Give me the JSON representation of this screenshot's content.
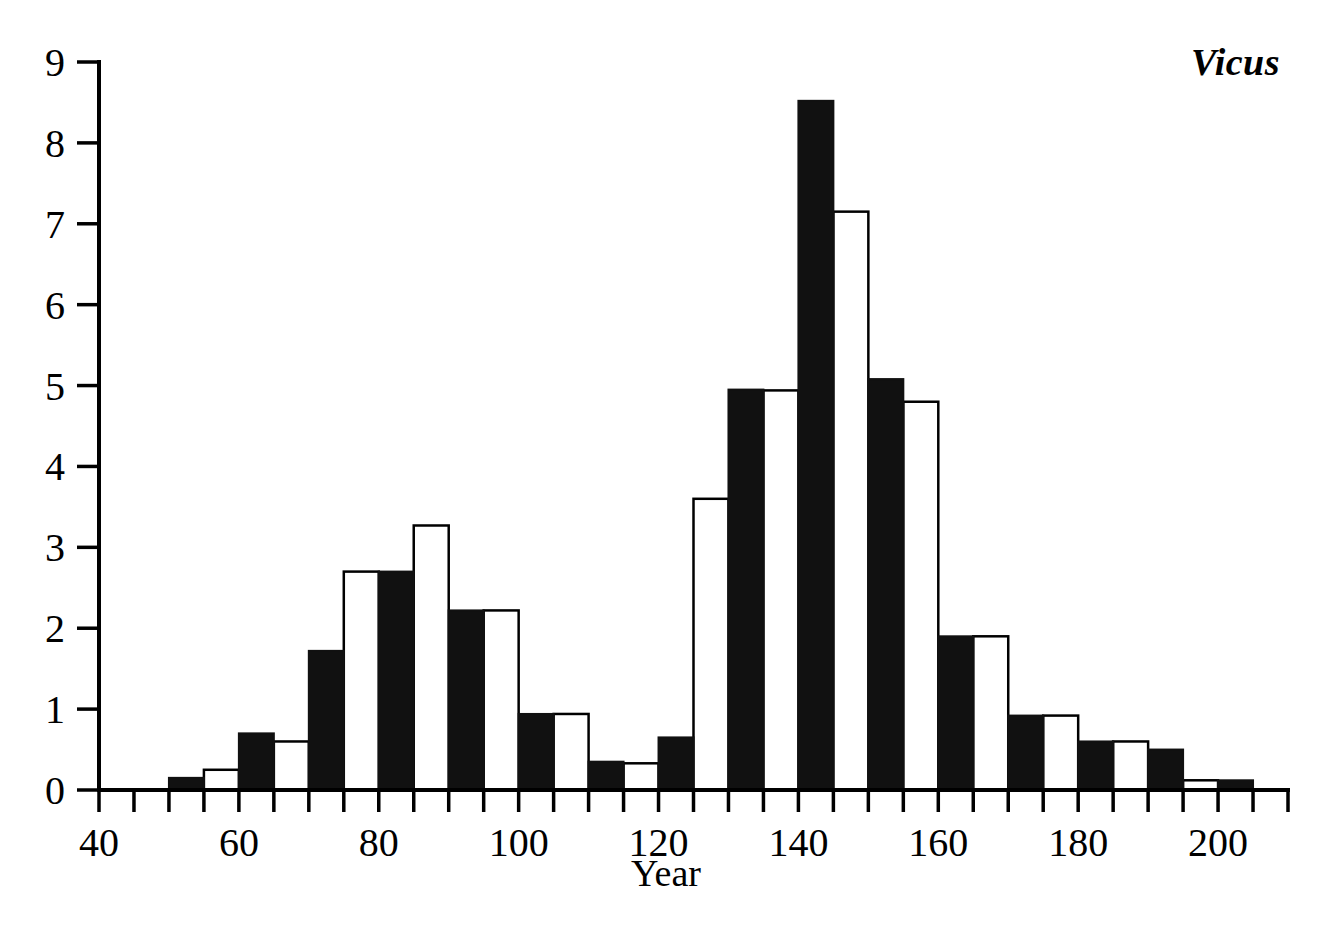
{
  "figure": {
    "title": "Vicus",
    "background_color": "#ffffff",
    "ink_color": "#000000"
  },
  "chart_data": {
    "type": "bar",
    "title": "Vicus",
    "subtitle": "",
    "xlabel": "Year",
    "ylabel": "",
    "xlim": [
      40,
      210
    ],
    "ylim": [
      0,
      9
    ],
    "grid": false,
    "legend_position": "none",
    "bar_width_years": 5,
    "x_tick_step": 5,
    "x_labeled_ticks": [
      40,
      60,
      80,
      100,
      120,
      140,
      160,
      180,
      200
    ],
    "x_tick_labels": [
      "40",
      "60",
      "80",
      "100",
      "120",
      "140",
      "160",
      "180",
      "200"
    ],
    "y_ticks": [
      0,
      1,
      2,
      3,
      4,
      5,
      6,
      7,
      8,
      9
    ],
    "y_tick_labels": [
      "0",
      "1",
      "2",
      "3",
      "4",
      "5",
      "6",
      "7",
      "8",
      "9"
    ],
    "bin_starts": [
      50,
      55,
      60,
      65,
      70,
      75,
      80,
      85,
      90,
      95,
      100,
      105,
      110,
      115,
      120,
      125,
      130,
      135,
      140,
      145,
      150,
      155,
      160,
      165,
      170,
      175,
      180,
      185,
      190,
      195,
      200
    ],
    "x": [
      52.5,
      57.5,
      62.5,
      67.5,
      72.5,
      77.5,
      82.5,
      87.5,
      92.5,
      97.5,
      102.5,
      107.5,
      112.5,
      117.5,
      122.5,
      127.5,
      132.5,
      137.5,
      142.5,
      147.5,
      152.5,
      157.5,
      162.5,
      167.5,
      172.5,
      177.5,
      182.5,
      187.5,
      192.5,
      197.5,
      202.5
    ],
    "values": [
      0.15,
      0.25,
      0.7,
      0.6,
      1.72,
      2.7,
      2.7,
      3.27,
      2.22,
      2.22,
      0.94,
      0.94,
      0.35,
      0.33,
      0.65,
      3.6,
      4.95,
      4.94,
      8.52,
      7.15,
      5.08,
      4.8,
      1.9,
      1.9,
      0.92,
      0.92,
      0.6,
      0.6,
      0.5,
      0.12,
      0.12
    ],
    "fills": [
      "filled",
      "open",
      "filled",
      "open",
      "filled",
      "open",
      "filled",
      "open",
      "filled",
      "open",
      "filled",
      "open",
      "filled",
      "open",
      "filled",
      "open",
      "filled",
      "open",
      "filled",
      "open",
      "filled",
      "open",
      "filled",
      "open",
      "filled",
      "open",
      "filled",
      "open",
      "filled",
      "open",
      "filled"
    ],
    "fill_colors": {
      "filled": "#111111",
      "open": "#ffffff",
      "outline": "#000000"
    }
  }
}
